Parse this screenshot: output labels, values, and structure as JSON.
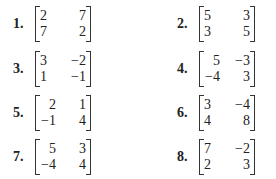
{
  "problems": [
    {
      "label": "1.",
      "matrix": [
        [
          "2",
          "7"
        ],
        [
          "7",
          "2"
        ]
      ]
    },
    {
      "label": "2.",
      "matrix": [
        [
          "5",
          "3"
        ],
        [
          "3",
          "5"
        ]
      ]
    },
    {
      "label": "3.",
      "matrix": [
        [
          "3",
          "−2"
        ],
        [
          "1",
          "−1"
        ]
      ]
    },
    {
      "label": "4.",
      "matrix": [
        [
          "5",
          "−3"
        ],
        [
          "−4",
          "3"
        ]
      ]
    },
    {
      "label": "5.",
      "matrix": [
        [
          "2",
          "1"
        ],
        [
          "−1",
          "4"
        ]
      ]
    },
    {
      "label": "6.",
      "matrix": [
        [
          "3",
          "−4"
        ],
        [
          "4",
          "8"
        ]
      ]
    },
    {
      "label": "7.",
      "matrix": [
        [
          "5",
          "3"
        ],
        [
          "−4",
          "4"
        ]
      ]
    },
    {
      "label": "8.",
      "matrix": [
        [
          "7",
          "−2"
        ],
        [
          "2",
          "3"
        ]
      ]
    }
  ]
}
